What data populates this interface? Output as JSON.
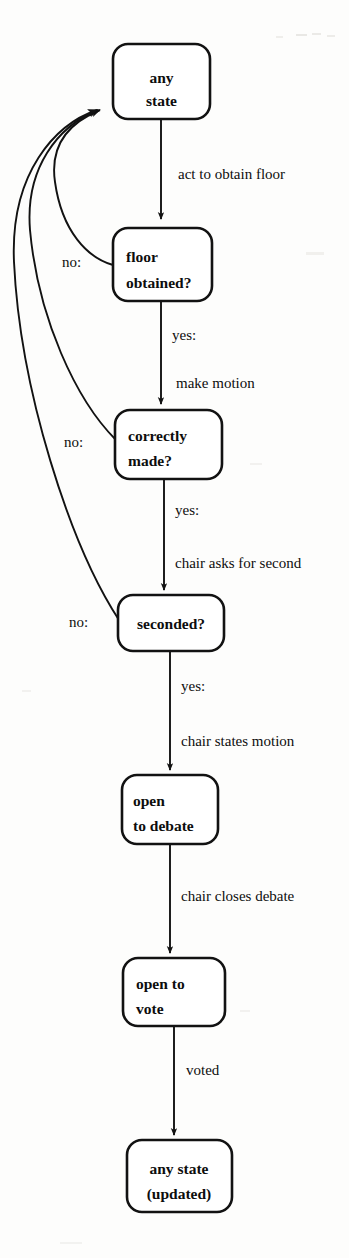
{
  "diagram": {
    "background_color": "#fdfdfc",
    "ink_color": "#121212",
    "nodes": [
      {
        "id": "any-state",
        "lines": [
          "any",
          "state"
        ],
        "align": "center"
      },
      {
        "id": "floor-obtained",
        "lines": [
          "floor",
          "obtained?"
        ],
        "align": "left"
      },
      {
        "id": "correctly-made",
        "lines": [
          "correctly",
          "made?"
        ],
        "align": "left"
      },
      {
        "id": "seconded",
        "lines": [
          "seconded?"
        ],
        "align": "center"
      },
      {
        "id": "open-to-debate",
        "lines": [
          "open",
          "to debate"
        ],
        "align": "left"
      },
      {
        "id": "open-to-vote",
        "lines": [
          "open to",
          "vote"
        ],
        "align": "left"
      },
      {
        "id": "any-state-updated",
        "lines": [
          "any state",
          "(updated)"
        ],
        "align": "center"
      }
    ],
    "edge_labels": [
      {
        "id": "act-to-obtain-floor",
        "text": "act to obtain floor"
      },
      {
        "id": "yes-floor",
        "text": "yes:"
      },
      {
        "id": "make-motion",
        "text": "make motion"
      },
      {
        "id": "yes-made",
        "text": "yes:"
      },
      {
        "id": "chair-asks-for-second",
        "text": "chair asks for second"
      },
      {
        "id": "yes-seconded",
        "text": "yes:"
      },
      {
        "id": "chair-states-motion",
        "text": "chair states motion"
      },
      {
        "id": "chair-closes-debate",
        "text": "chair closes debate"
      },
      {
        "id": "voted",
        "text": "voted"
      }
    ],
    "branch_labels": [
      {
        "id": "no-floor",
        "text": "no:"
      },
      {
        "id": "no-made",
        "text": "no:"
      },
      {
        "id": "no-seconded",
        "text": "no:"
      }
    ]
  }
}
